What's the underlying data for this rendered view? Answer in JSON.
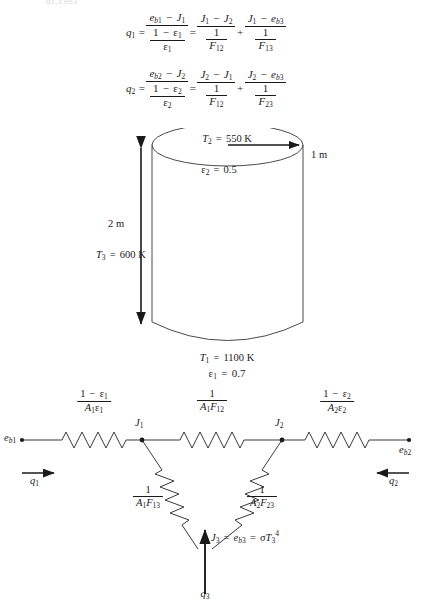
{
  "figure": {
    "clipped_header_text": "q1,3          eb3",
    "equations": [
      {
        "id": "q1-equation",
        "lhs": "q1",
        "terms": [
          {
            "numerator": "eb1 − J1",
            "denominator": "(1 − ε1)/ε1"
          },
          {
            "numerator": "J1 − J2",
            "denominator": "1/F12"
          },
          {
            "numerator": "J1 − eb3",
            "denominator": "1/F13"
          }
        ],
        "operators": [
          "=",
          "=",
          "+"
        ],
        "plain": "q1 = (eb1 - J1)/((1-e1)/e1) = (J1 - J2)/(1/F12) + (J1 - eb3)/(1/F13)"
      },
      {
        "id": "q2-equation",
        "lhs": "q2",
        "terms": [
          {
            "numerator": "eb2 − J2",
            "denominator": "(1 − ε2)/ε2"
          },
          {
            "numerator": "J2 − J1",
            "denominator": "1/F12"
          },
          {
            "numerator": "J2 − eb3",
            "denominator": "1/F23"
          }
        ],
        "operators": [
          "=",
          "=",
          "+"
        ],
        "plain": "q2 = (eb2 - J2)/((1-e2)/e2) = (J2 - J1)/(1/F12) + (J2 - eb3)/(1/F23)"
      }
    ],
    "cylinder": {
      "name": "enclosure-cylinder",
      "top_surface": {
        "temperature_label": "T2 = 550 K",
        "temperature_symbol": "T",
        "temperature_sub": "2",
        "temperature_value": "550 K",
        "emissivity_symbol": "ε",
        "emissivity_sub": "2",
        "emissivity_value": "0.5"
      },
      "bottom_surface": {
        "temperature_symbol": "T",
        "temperature_sub": "1",
        "temperature_value": "1100 K",
        "emissivity_symbol": "ε",
        "emissivity_sub": "1",
        "emissivity_value": "0.7"
      },
      "side_surface": {
        "temperature_symbol": "T",
        "temperature_sub": "3",
        "temperature_value": "600 K"
      },
      "dimensions": {
        "height_label": "2 m",
        "radius_label": "1 m"
      }
    },
    "network": {
      "name": "radiation-resistance-network",
      "nodes": [
        {
          "id": "node-eb1",
          "symbol": "e",
          "sub": "b1"
        },
        {
          "id": "node-J1",
          "symbol": "J",
          "sub": "1"
        },
        {
          "id": "node-J2",
          "symbol": "J",
          "sub": "2"
        },
        {
          "id": "node-eb2",
          "symbol": "e",
          "sub": "b2"
        },
        {
          "id": "node-J3",
          "label": "J3 = eb3 = σT3⁴"
        }
      ],
      "resistors": [
        {
          "id": "surface-resistance-1",
          "numerator": "1 − ε1",
          "denominator": "A1ε1"
        },
        {
          "id": "space-resistance-12",
          "numerator": "1",
          "denominator": "A1F12"
        },
        {
          "id": "surface-resistance-2",
          "numerator": "1 − ε2",
          "denominator": "A2ε2"
        },
        {
          "id": "space-resistance-13",
          "numerator": "1",
          "denominator": "A1F13"
        },
        {
          "id": "space-resistance-23",
          "numerator": "1",
          "denominator": "A2F23"
        }
      ],
      "currents": [
        {
          "id": "current-q1",
          "symbol": "q",
          "sub": "1",
          "direction": "right"
        },
        {
          "id": "current-q2",
          "symbol": "q",
          "sub": "2",
          "direction": "left"
        },
        {
          "id": "current-q3",
          "symbol": "q",
          "sub": "3",
          "direction": "up"
        }
      ]
    },
    "colors": {
      "ink": "#1a1a1a",
      "background": "#ffffff",
      "faint": "#b9b9b9"
    }
  }
}
